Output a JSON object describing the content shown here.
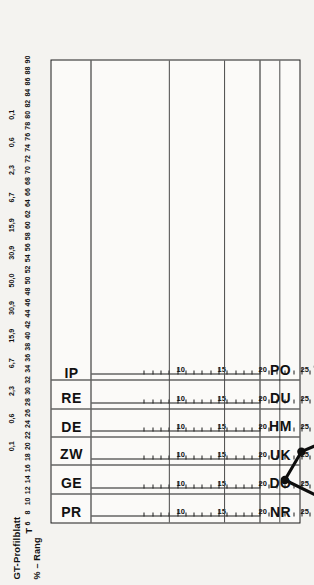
{
  "titles": {
    "main": "GT-Profilblatt",
    "sub": "% – Rang",
    "t_label": "T"
  },
  "chart_data": {
    "type": "line",
    "title": "GT-Profilblatt",
    "subtitle": "% – Rang",
    "xlabel": "T",
    "ylabel": "",
    "grid": true,
    "legend": null,
    "orientation": "rotated-90",
    "t_axis": {
      "label": "T",
      "range": [
        6,
        90
      ],
      "step": 2,
      "ticks": [
        6,
        8,
        10,
        12,
        14,
        16,
        18,
        20,
        22,
        24,
        26,
        28,
        30,
        32,
        34,
        36,
        38,
        40,
        42,
        44,
        46,
        48,
        50,
        52,
        54,
        56,
        58,
        60,
        62,
        64,
        66,
        68,
        70,
        72,
        74,
        76,
        78,
        80,
        82,
        84,
        86,
        88,
        90
      ],
      "major_ticks": [
        20,
        30,
        40,
        50,
        60,
        70,
        80
      ]
    },
    "percent_axis": {
      "label": "% – Rang",
      "marks": [
        {
          "value": "0,1",
          "t": 20
        },
        {
          "value": "0,6",
          "t": 25
        },
        {
          "value": "2,3",
          "t": 30
        },
        {
          "value": "6,7",
          "t": 35
        },
        {
          "value": "15,9",
          "t": 40
        },
        {
          "value": "30,9",
          "t": 45
        },
        {
          "value": "50,0",
          "t": 50
        },
        {
          "value": "30,9",
          "t": 55
        },
        {
          "value": "15,9",
          "t": 60
        },
        {
          "value": "6,7",
          "t": 65
        },
        {
          "value": "2,3",
          "t": 70
        },
        {
          "value": "0,6",
          "t": 75
        },
        {
          "value": "0,1",
          "t": 80
        }
      ]
    },
    "categories": [
      "NR",
      "DO",
      "UK",
      "HM",
      "DU",
      "PO"
    ],
    "pole_left": [
      "NR",
      "DO",
      "UK",
      "HM",
      "DU",
      "PO"
    ],
    "pole_right": [
      "PR",
      "GE",
      "ZW",
      "DE",
      "RE",
      "IP"
    ],
    "scales": [
      {
        "left": "NR",
        "right": "PR",
        "raw_ticks": [
          10,
          15,
          20,
          25,
          30,
          35,
          40
        ],
        "raw_tick_t": [
          21.5,
          29.0,
          36.5,
          44.0,
          51.5,
          59.0,
          66.5
        ],
        "raw_min": 6,
        "raw_max": 44,
        "value": 30,
        "t_value": 51.5
      },
      {
        "left": "DO",
        "right": "GE",
        "raw_ticks": [
          10,
          15,
          20,
          25,
          30,
          35,
          40
        ],
        "raw_tick_t": [
          21.5,
          29.0,
          36.5,
          44.0,
          51.5,
          59.0,
          66.5
        ],
        "raw_min": 6,
        "raw_max": 44,
        "value": 23,
        "t_value": 41.0
      },
      {
        "left": "UK",
        "right": "ZW",
        "raw_ticks": [
          10,
          15,
          20,
          25,
          30,
          35,
          40
        ],
        "raw_tick_t": [
          21.5,
          29.0,
          36.5,
          44.0,
          51.5,
          59.0,
          66.5
        ],
        "raw_min": 6,
        "raw_max": 44,
        "value": 25,
        "t_value": 44.0
      },
      {
        "left": "HM",
        "right": "DE",
        "raw_ticks": [
          10,
          15,
          20,
          25,
          30,
          35,
          40
        ],
        "raw_tick_t": [
          21.5,
          29.0,
          36.5,
          44.0,
          51.5,
          59.0,
          66.5
        ],
        "raw_min": 6,
        "raw_max": 44,
        "value": 33,
        "t_value": 56.0
      },
      {
        "left": "DU",
        "right": "RE",
        "raw_ticks": [
          10,
          15,
          20,
          25,
          30,
          35,
          40
        ],
        "raw_tick_t": [
          21.5,
          29.0,
          36.5,
          44.0,
          51.5,
          59.0,
          66.5
        ],
        "raw_min": 6,
        "raw_max": 44,
        "value": 23,
        "t_value": 50.0
      },
      {
        "left": "PO",
        "right": "IP",
        "raw_ticks": [
          10,
          15,
          20,
          25,
          30,
          35,
          40
        ],
        "raw_tick_t": [
          21.5,
          29.0,
          36.5,
          44.0,
          51.5,
          59.0,
          66.5
        ],
        "raw_min": 6,
        "raw_max": 44,
        "value": 20,
        "t_value": 47.0
      }
    ],
    "series": [
      {
        "name": "Profil",
        "values": [
          30,
          23,
          25,
          33,
          23,
          20
        ],
        "t_values": [
          51.5,
          41.0,
          44.0,
          56.0,
          50.0,
          47.0
        ]
      }
    ],
    "colors": {
      "line": "#0d0d0d",
      "marker": "#0d0d0d",
      "frame": "#1b1b1b",
      "grid": "#4a4a4a",
      "paper": "#f4f3f0"
    }
  }
}
